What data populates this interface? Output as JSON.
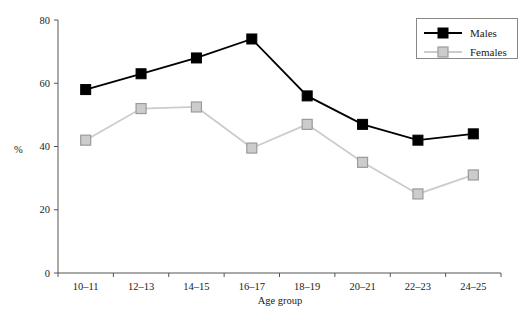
{
  "chart_data": {
    "type": "line",
    "title": "",
    "xlabel": "Age group",
    "ylabel": "%",
    "categories": [
      "10–11",
      "12–13",
      "14–15",
      "16–17",
      "18–19",
      "20–21",
      "22–23",
      "24–25"
    ],
    "series": [
      {
        "name": "Males",
        "values": [
          58,
          63,
          68,
          74,
          56,
          47,
          42,
          44
        ],
        "color": "#000000",
        "marker": "filled-square"
      },
      {
        "name": "Females",
        "values": [
          42,
          52,
          52.5,
          39.5,
          47,
          35,
          25,
          31
        ],
        "color": "#cccccc",
        "marker": "open-square"
      }
    ],
    "ylim": [
      0,
      80
    ],
    "yticks": [
      0,
      20,
      40,
      60,
      80
    ],
    "ytick_labels": [
      "0",
      "20",
      "40",
      "60",
      "80"
    ],
    "grid": false,
    "legend_position": "top-right"
  },
  "legend": {
    "entries": [
      {
        "label": "Males"
      },
      {
        "label": "Females"
      }
    ]
  },
  "axes": {
    "y_label": "%",
    "x_label": "Age group"
  },
  "colors": {
    "males": "#000000",
    "females": "#cccccc",
    "axis": "#555555",
    "text": "#1a1a1a"
  }
}
